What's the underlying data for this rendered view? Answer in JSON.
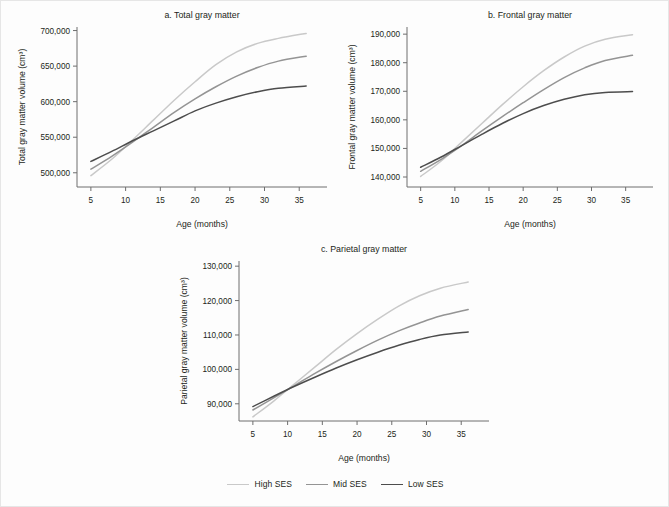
{
  "figure": {
    "legend": {
      "position": "bottom-center",
      "items": [
        {
          "label": "High SES",
          "color": "#c9c9c9"
        },
        {
          "label": "Mid SES",
          "color": "#949494"
        },
        {
          "label": "Low SES",
          "color": "#4d4d4d"
        }
      ]
    }
  },
  "chart_data": [
    {
      "id": "a",
      "type": "line",
      "title": "a. Total gray matter",
      "xlabel": "Age (months)",
      "ylabel": "Total gray matter volume (cm³)",
      "xlim": [
        3,
        39
      ],
      "ylim": [
        480000,
        705000
      ],
      "xticks": [
        5,
        10,
        15,
        20,
        25,
        30,
        35
      ],
      "xticklabels": [
        "5",
        "10",
        "15",
        "20",
        "25",
        "30",
        "35"
      ],
      "yticks": [
        500000,
        550000,
        600000,
        650000,
        700000
      ],
      "yticklabels": [
        "500,000",
        "550,000",
        "600,000",
        "650,000",
        "700,000"
      ],
      "grid": false,
      "x": [
        5,
        8,
        11,
        14,
        17,
        20,
        23,
        26,
        29,
        32,
        36
      ],
      "series": [
        {
          "name": "High SES",
          "color": "#c9c9c9",
          "width": 1.5,
          "values": [
            496000,
            519000,
            546000,
            574000,
            602000,
            628000,
            652000,
            670000,
            682000,
            689000,
            696000
          ]
        },
        {
          "name": "Mid SES",
          "color": "#949494",
          "width": 1.5,
          "values": [
            505000,
            523000,
            543000,
            564000,
            585000,
            604000,
            621000,
            636000,
            648000,
            657000,
            664000
          ]
        },
        {
          "name": "Low SES",
          "color": "#4d4d4d",
          "width": 1.5,
          "values": [
            516000,
            530000,
            545000,
            559000,
            573000,
            587000,
            598000,
            607000,
            614000,
            619000,
            622000
          ]
        }
      ]
    },
    {
      "id": "b",
      "type": "line",
      "title": "b. Frontal gray matter",
      "xlabel": "Age (months)",
      "ylabel": "Frontal gray matter volume (cm³)",
      "xlim": [
        3,
        39
      ],
      "ylim": [
        136500,
        192500
      ],
      "xticks": [
        5,
        10,
        15,
        20,
        25,
        30,
        35
      ],
      "xticklabels": [
        "5",
        "10",
        "15",
        "20",
        "25",
        "30",
        "35"
      ],
      "yticks": [
        140000,
        150000,
        160000,
        170000,
        180000,
        190000
      ],
      "yticklabels": [
        "140,000",
        "150,000",
        "160,000",
        "170,000",
        "180,000",
        "190,000"
      ],
      "grid": false,
      "x": [
        5,
        8,
        11,
        14,
        17,
        20,
        23,
        26,
        29,
        32,
        36
      ],
      "series": [
        {
          "name": "High SES",
          "color": "#c9c9c9",
          "width": 1.5,
          "values": [
            140200,
            145600,
            152200,
            158800,
            165400,
            171600,
            177200,
            182000,
            185800,
            188200,
            189800
          ]
        },
        {
          "name": "Mid SES",
          "color": "#949494",
          "width": 1.5,
          "values": [
            142000,
            146200,
            151000,
            156200,
            161200,
            166000,
            170600,
            174800,
            178200,
            180800,
            182600
          ]
        },
        {
          "name": "Low SES",
          "color": "#4d4d4d",
          "width": 1.5,
          "values": [
            143400,
            147000,
            151000,
            155000,
            158800,
            162200,
            165000,
            167200,
            168800,
            169600,
            169900
          ]
        }
      ]
    },
    {
      "id": "c",
      "type": "line",
      "title": "c. Parietal gray matter",
      "xlabel": "Age (months)",
      "ylabel": "Parietal gray matter volume (cm³)",
      "xlim": [
        3,
        39
      ],
      "ylim": [
        85000,
        131500
      ],
      "xticks": [
        5,
        10,
        15,
        20,
        25,
        30,
        35
      ],
      "xticklabels": [
        "5",
        "10",
        "15",
        "20",
        "25",
        "30",
        "35"
      ],
      "yticks": [
        90000,
        100000,
        110000,
        120000,
        130000
      ],
      "yticklabels": [
        "90,000",
        "100,000",
        "110,000",
        "120,000",
        "130,000"
      ],
      "grid": false,
      "x": [
        5,
        8,
        11,
        14,
        17,
        20,
        23,
        26,
        29,
        32,
        36
      ],
      "series": [
        {
          "name": "High SES",
          "color": "#c9c9c9",
          "width": 1.5,
          "values": [
            86200,
            90800,
            95800,
            100800,
            105800,
            110400,
            114600,
            118400,
            121400,
            123600,
            125400
          ]
        },
        {
          "name": "Mid SES",
          "color": "#949494",
          "width": 1.5,
          "values": [
            88200,
            91700,
            95300,
            98900,
            102300,
            105500,
            108500,
            111200,
            113500,
            115500,
            117400
          ]
        },
        {
          "name": "Low SES",
          "color": "#4d4d4d",
          "width": 1.5,
          "values": [
            89200,
            92200,
            95100,
            97800,
            100400,
            102800,
            105000,
            107000,
            108700,
            110000,
            110900
          ]
        }
      ]
    }
  ]
}
